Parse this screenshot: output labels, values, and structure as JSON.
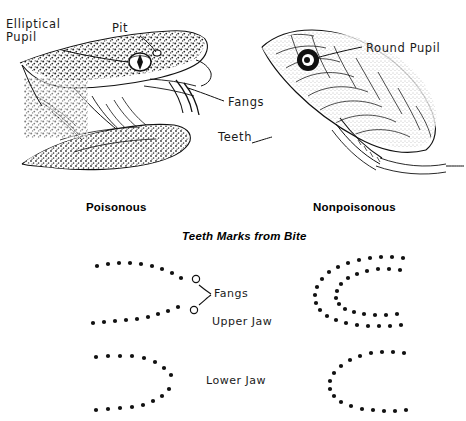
{
  "figure": {
    "background_color": "#ffffff",
    "ink_color": "#111111",
    "title_caption": "Teeth Marks from Bite"
  },
  "heads": {
    "left": {
      "type_label": "poisonous-pit-viper-head",
      "labels": {
        "pupil": "Elliptical\nPupil",
        "pit": "Pit",
        "fangs": "Fangs"
      }
    },
    "right": {
      "type_label": "nonpoisonous-snake-head",
      "labels": {
        "pupil": "Round Pupil",
        "teeth": "Teeth"
      }
    }
  },
  "columns": {
    "left_heading": "Poisonous",
    "right_heading": "Nonpoisonous"
  },
  "bite_labels": {
    "fangs": "Fangs",
    "upper_jaw": "Upper Jaw",
    "lower_jaw": "Lower Jaw"
  },
  "chart_data": {
    "type": "scatter",
    "title": "Teeth Marks from Bite",
    "grid": false,
    "legend": false,
    "series": [
      {
        "name": "poisonous-upper-jaw-top-row",
        "marker": "dot",
        "points": [
          [
            97,
            266
          ],
          [
            108,
            264
          ],
          [
            119,
            263
          ],
          [
            130,
            263
          ],
          [
            141,
            264
          ],
          [
            152,
            266
          ],
          [
            162,
            269
          ],
          [
            172,
            273
          ],
          [
            181,
            278
          ]
        ]
      },
      {
        "name": "poisonous-upper-jaw-fang-top",
        "marker": "open-circle",
        "points": [
          [
            196,
            279
          ]
        ]
      },
      {
        "name": "poisonous-upper-jaw-fang-bottom",
        "marker": "open-circle",
        "points": [
          [
            194,
            310
          ]
        ]
      },
      {
        "name": "poisonous-upper-jaw-bottom-row",
        "marker": "dot",
        "points": [
          [
            93,
            323
          ],
          [
            104,
            322
          ],
          [
            115,
            321
          ],
          [
            126,
            320
          ],
          [
            137,
            319
          ],
          [
            148,
            317
          ],
          [
            158,
            314
          ],
          [
            168,
            311
          ],
          [
            178,
            307
          ]
        ]
      },
      {
        "name": "poisonous-lower-jaw-top-row",
        "marker": "dot",
        "points": [
          [
            96,
            357
          ],
          [
            108,
            356
          ],
          [
            120,
            356
          ],
          [
            132,
            356
          ],
          [
            144,
            358
          ],
          [
            155,
            362
          ],
          [
            164,
            368
          ],
          [
            171,
            375
          ]
        ]
      },
      {
        "name": "poisonous-lower-jaw-bottom-row",
        "marker": "dot",
        "points": [
          [
            96,
            410
          ],
          [
            108,
            409
          ],
          [
            120,
            408
          ],
          [
            132,
            407
          ],
          [
            143,
            405
          ],
          [
            153,
            401
          ],
          [
            162,
            396
          ],
          [
            169,
            389
          ]
        ]
      },
      {
        "name": "nonpoisonous-upper-jaw-outer-arc",
        "marker": "dot",
        "points": [
          [
            403,
            258
          ],
          [
            392,
            257
          ],
          [
            381,
            257
          ],
          [
            370,
            258
          ],
          [
            359,
            260
          ],
          [
            348,
            263
          ],
          [
            338,
            267
          ],
          [
            329,
            272
          ],
          [
            322,
            279
          ],
          [
            317,
            287
          ],
          [
            315,
            295
          ],
          [
            316,
            303
          ],
          [
            320,
            310
          ],
          [
            327,
            316
          ],
          [
            336,
            320
          ],
          [
            346,
            323
          ],
          [
            357,
            325
          ],
          [
            368,
            326
          ],
          [
            379,
            326
          ],
          [
            390,
            326
          ],
          [
            401,
            325
          ]
        ]
      },
      {
        "name": "nonpoisonous-upper-jaw-inner-arc",
        "marker": "dot",
        "points": [
          [
            400,
            270
          ],
          [
            389,
            269
          ],
          [
            378,
            269
          ],
          [
            367,
            271
          ],
          [
            357,
            274
          ],
          [
            348,
            278
          ],
          [
            341,
            284
          ],
          [
            337,
            291
          ],
          [
            336,
            298
          ],
          [
            339,
            304
          ],
          [
            345,
            309
          ],
          [
            354,
            312
          ],
          [
            364,
            314
          ],
          [
            375,
            315
          ],
          [
            386,
            315
          ],
          [
            397,
            314
          ]
        ]
      },
      {
        "name": "nonpoisonous-lower-jaw-arc",
        "marker": "dot",
        "points": [
          [
            404,
            353
          ],
          [
            393,
            352
          ],
          [
            382,
            352
          ],
          [
            371,
            353
          ],
          [
            360,
            356
          ],
          [
            350,
            360
          ],
          [
            341,
            366
          ],
          [
            334,
            373
          ],
          [
            330,
            381
          ],
          [
            330,
            389
          ],
          [
            334,
            396
          ],
          [
            341,
            402
          ],
          [
            351,
            406
          ],
          [
            362,
            409
          ],
          [
            373,
            410
          ],
          [
            384,
            411
          ],
          [
            395,
            411
          ],
          [
            406,
            410
          ]
        ]
      }
    ],
    "annotations": [
      {
        "text": "Poisonous",
        "x": 86,
        "y": 208
      },
      {
        "text": "Nonpoisonous",
        "x": 313,
        "y": 208
      },
      {
        "text": "Teeth Marks from Bite",
        "x": 182,
        "y": 237
      },
      {
        "text": "Fangs",
        "x": 214,
        "y": 294
      },
      {
        "text": "Upper Jaw",
        "x": 212,
        "y": 322
      },
      {
        "text": "Lower Jaw",
        "x": 206,
        "y": 381
      }
    ]
  }
}
